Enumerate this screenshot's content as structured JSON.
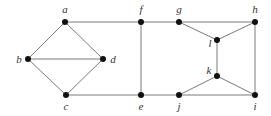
{
  "diagram": {
    "type": "undirected-graph",
    "nodes": [
      {
        "id": "a",
        "label": "a",
        "x": 65,
        "y": 22,
        "lx": 65,
        "ly": 13,
        "anchor": "middle"
      },
      {
        "id": "b",
        "label": "b",
        "x": 28,
        "y": 59,
        "lx": 19,
        "ly": 63,
        "anchor": "middle"
      },
      {
        "id": "c",
        "label": "c",
        "x": 66,
        "y": 95,
        "lx": 66,
        "ly": 110,
        "anchor": "middle"
      },
      {
        "id": "d",
        "label": "d",
        "x": 103,
        "y": 59,
        "lx": 113,
        "ly": 63,
        "anchor": "middle"
      },
      {
        "id": "e",
        "label": "e",
        "x": 141,
        "y": 95,
        "lx": 141,
        "ly": 110,
        "anchor": "middle"
      },
      {
        "id": "f",
        "label": "f",
        "x": 141,
        "y": 22,
        "lx": 141,
        "ly": 13,
        "anchor": "middle"
      },
      {
        "id": "g",
        "label": "g",
        "x": 179,
        "y": 22,
        "lx": 179,
        "ly": 13,
        "anchor": "middle"
      },
      {
        "id": "h",
        "label": "h",
        "x": 255,
        "y": 22,
        "lx": 255,
        "ly": 13,
        "anchor": "middle"
      },
      {
        "id": "i",
        "label": "i",
        "x": 255,
        "y": 95,
        "lx": 255,
        "ly": 110,
        "anchor": "middle"
      },
      {
        "id": "j",
        "label": "j",
        "x": 179,
        "y": 95,
        "lx": 179,
        "ly": 110,
        "anchor": "middle"
      },
      {
        "id": "k",
        "label": "k",
        "x": 217,
        "y": 76,
        "lx": 209,
        "ly": 74,
        "anchor": "middle"
      },
      {
        "id": "l",
        "label": "l",
        "x": 217,
        "y": 40,
        "lx": 210,
        "ly": 47,
        "anchor": "middle"
      }
    ],
    "edges": [
      [
        "a",
        "b"
      ],
      [
        "a",
        "d"
      ],
      [
        "b",
        "d"
      ],
      [
        "b",
        "c"
      ],
      [
        "c",
        "d"
      ],
      [
        "a",
        "f"
      ],
      [
        "c",
        "e"
      ],
      [
        "f",
        "e"
      ],
      [
        "f",
        "g"
      ],
      [
        "g",
        "h"
      ],
      [
        "g",
        "l"
      ],
      [
        "h",
        "l"
      ],
      [
        "h",
        "i"
      ],
      [
        "l",
        "k"
      ],
      [
        "k",
        "j"
      ],
      [
        "k",
        "i"
      ],
      [
        "e",
        "j"
      ],
      [
        "j",
        "i"
      ]
    ]
  }
}
